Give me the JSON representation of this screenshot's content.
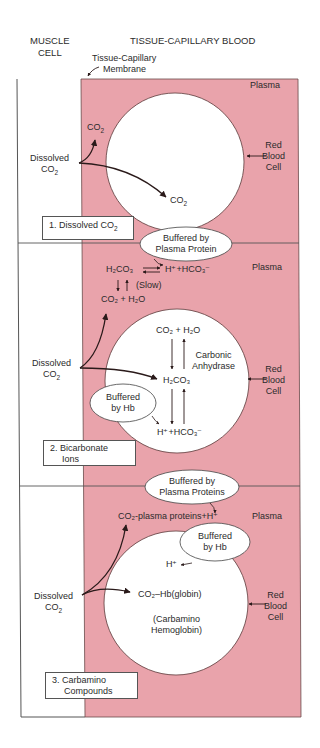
{
  "colors": {
    "plasma": "#e9a3ab",
    "line": "#4a3a3a",
    "cell": "#ffffff",
    "arrow": "#2a1a1a"
  },
  "headers": {
    "muscle_cell": "MUSCLE\nCELL",
    "muscle_line1": "MUSCLE",
    "muscle_line2": "CELL",
    "tissue_blood": "TISSUE-CAPILLARY BLOOD",
    "membrane_line1": "Tissue-Capillary",
    "membrane_line2": "Membrane"
  },
  "panels": [
    {
      "label_line1": "1.  Dissolved CO",
      "label_sub": "2",
      "plasma": "Plasma",
      "rbc_line1": "Red",
      "rbc_line2": "Blood",
      "rbc_line3": "Cell",
      "source_line1": "Dissolved",
      "source_line2": "CO",
      "source_sub": "2",
      "co2_plasma": "CO",
      "co2_plasma_sub": "2",
      "co2_cell": "CO",
      "co2_cell_sub": "2"
    },
    {
      "label_line1": "2.  Bicarbonate",
      "label_line2": "Ions",
      "plasma": "Plasma",
      "rbc_line1": "Red",
      "rbc_line2": "Blood",
      "rbc_line3": "Cell",
      "source_line1": "Dissolved",
      "source_line2": "CO",
      "source_sub": "2",
      "buffer_plasma_line1": "Buffered by",
      "buffer_plasma_line2": "Plasma Protein",
      "buffer_hb_line1": "Buffered",
      "buffer_hb_line2": "by Hb",
      "plasma_h2co3": "H₂CO₃",
      "plasma_products": "H⁺+HCO₃⁻",
      "slow": "(Slow)",
      "plasma_reactants": "CO₂ + H₂O",
      "cell_reactants": "CO₂ + H₂O",
      "enzyme_line1": "Carbonic",
      "enzyme_line2": "Anhydrase",
      "cell_h2co3": "H₂CO₃",
      "cell_products": "H⁺+HCO₃⁻"
    },
    {
      "label_line1": "3.  Carbamino",
      "label_line2": "Compounds",
      "plasma": "Plasma",
      "rbc_line1": "Red",
      "rbc_line2": "Blood",
      "rbc_line3": "Cell",
      "source_line1": "Dissolved",
      "source_line2": "CO",
      "source_sub": "2",
      "buffer_plasma_line1": "Buffered by",
      "buffer_plasma_line2": "Plasma Proteins",
      "buffer_hb_line1": "Buffered",
      "buffer_hb_line2": "by Hb",
      "plasma_product": "CO₂-plasma proteins+H⁺",
      "h_plus": "H⁺",
      "cell_product": "CO₂–Hb(globin)",
      "cell_note_line1": "(Carbamino",
      "cell_note_line2": "Hemoglobin)"
    }
  ]
}
